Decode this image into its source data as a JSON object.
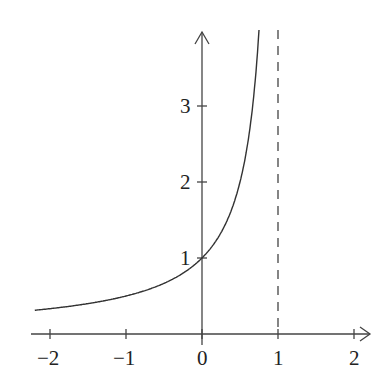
{
  "chart_data": {
    "type": "line",
    "title": "",
    "xlabel": "",
    "ylabel": "",
    "function": "y = 1/(1 - x)",
    "xlim": [
      -2.2,
      2.3
    ],
    "ylim": [
      0,
      4.0
    ],
    "x_ticks": [
      -2,
      -1,
      0,
      1,
      2
    ],
    "x_tick_labels": [
      "−2",
      "−1",
      "0",
      "1",
      "2"
    ],
    "y_ticks": [
      1,
      2,
      3
    ],
    "y_tick_labels": [
      "1",
      "2",
      "3"
    ],
    "asymptote": {
      "x": 1,
      "style": "dashed"
    },
    "x": [
      -2.2,
      -2,
      -1.5,
      -1,
      -0.5,
      0,
      0.25,
      0.5,
      0.6,
      0.7,
      0.75
    ],
    "series": [
      {
        "name": "f(x)",
        "values": [
          0.3125,
          0.333,
          0.4,
          0.5,
          0.667,
          1.0,
          1.333,
          2.0,
          2.5,
          3.333,
          4.0
        ]
      }
    ],
    "grid": false,
    "legend": null
  },
  "colors": {
    "line": "#333333",
    "axis": "#444444",
    "background": "#ffffff"
  }
}
